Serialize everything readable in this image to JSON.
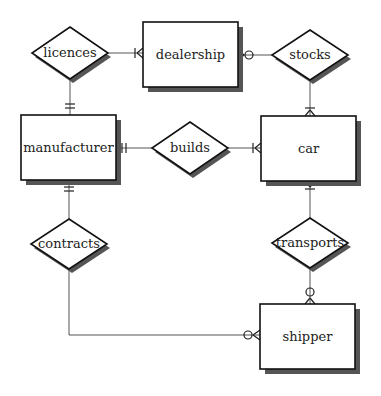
{
  "diagram": {
    "type": "entity-relationship",
    "notation": "crow's foot",
    "colors": {
      "background": "#ffffff",
      "stroke": "#111111",
      "shadow": "#555555",
      "edge": "#555555",
      "text": "#222222"
    },
    "entities": [
      {
        "id": "dealership",
        "label": "dealership"
      },
      {
        "id": "manufacturer",
        "label": "manufacturer"
      },
      {
        "id": "car",
        "label": "car"
      },
      {
        "id": "shipper",
        "label": "shipper"
      }
    ],
    "relationships": [
      {
        "id": "licences",
        "label": "licences"
      },
      {
        "id": "stocks",
        "label": "stocks"
      },
      {
        "id": "builds",
        "label": "builds"
      },
      {
        "id": "contracts",
        "label": "contracts"
      },
      {
        "id": "transports",
        "label": "transports"
      }
    ],
    "connections": [
      {
        "relationship": "licences",
        "entity": "manufacturer",
        "cardinality": "one-and-only-one"
      },
      {
        "relationship": "licences",
        "entity": "dealership",
        "cardinality": "one-or-many"
      },
      {
        "relationship": "stocks",
        "entity": "dealership",
        "cardinality": "zero-or-many"
      },
      {
        "relationship": "stocks",
        "entity": "car",
        "cardinality": "one-or-many"
      },
      {
        "relationship": "builds",
        "entity": "manufacturer",
        "cardinality": "one-and-only-one"
      },
      {
        "relationship": "builds",
        "entity": "car",
        "cardinality": "one-or-many"
      },
      {
        "relationship": "contracts",
        "entity": "manufacturer",
        "cardinality": "one-and-only-one"
      },
      {
        "relationship": "contracts",
        "entity": "shipper",
        "cardinality": "zero-or-many"
      },
      {
        "relationship": "transports",
        "entity": "car",
        "cardinality": "one-or-many"
      },
      {
        "relationship": "transports",
        "entity": "shipper",
        "cardinality": "zero-or-many"
      }
    ]
  }
}
